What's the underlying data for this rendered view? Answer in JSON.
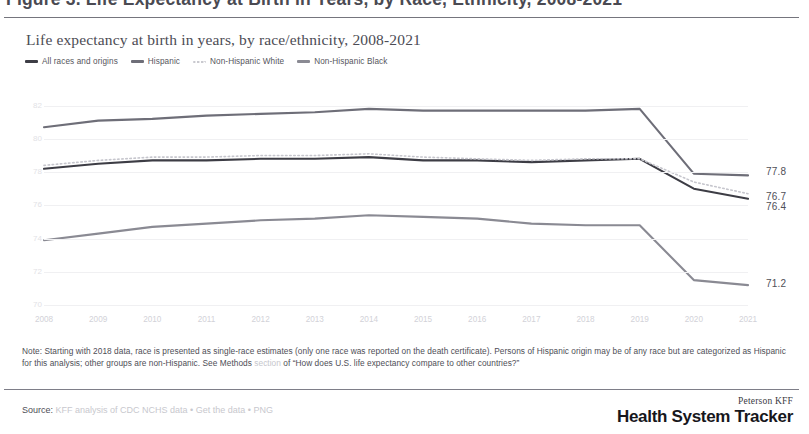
{
  "header": {
    "title": "Figure 3. Life Expectancy at Birth in Years, by Race, Ethnicity, 2008-2021"
  },
  "chart_panel": {
    "subtitle": "Life expectancy at birth in years, by race/ethnicity, 2008-2021"
  },
  "note": {
    "line1": "Note: Starting with 2018 data, race is presented as single-race estimates (only one race was reported on the death certificate). Persons of Hispanic origin may",
    "line2a": "be of any race but are categorized as Hispanic for this analysis; other groups are non-Hispanic. See Methods",
    "line2b": "section",
    "line2c": "of “How does U.S. life expectancy compare",
    "line3": "to other countries?”"
  },
  "footer": {
    "source_label": "Source:",
    "source_faded": "KFF analysis of CDC NCHS data • Get the data • PNG",
    "brand_top": "Peterson KFF",
    "brand_main": "Health System Tracker"
  },
  "chart_data": {
    "type": "line",
    "title": "Life expectancy at birth in years, by race/ethnicity, 2008-2021",
    "xlabel": "",
    "ylabel": "",
    "x": [
      2008,
      2009,
      2010,
      2011,
      2012,
      2013,
      2014,
      2015,
      2016,
      2017,
      2018,
      2019,
      2020,
      2021
    ],
    "categories": [
      "2008",
      "2009",
      "2010",
      "2011",
      "2012",
      "2013",
      "2014",
      "2015",
      "2016",
      "2017",
      "2018",
      "2019",
      "2020",
      "2021"
    ],
    "xlim": [
      2008,
      2021
    ],
    "ylim": [
      70,
      83
    ],
    "yticks": [
      70,
      72,
      74,
      76,
      78,
      80,
      82
    ],
    "ytick_labels": [
      "70",
      "72",
      "74",
      "76",
      "78",
      "80",
      "82"
    ],
    "grid": true,
    "legend_position": "top-left",
    "series": [
      {
        "name": "All races and origins",
        "color": "#3d3d45",
        "style": "solid",
        "end_label": "76.4",
        "values": [
          78.2,
          78.5,
          78.7,
          78.7,
          78.8,
          78.8,
          78.9,
          78.7,
          78.7,
          78.6,
          78.7,
          78.8,
          77.0,
          76.4
        ]
      },
      {
        "name": "Hispanic",
        "color": "#6e6e78",
        "style": "solid",
        "end_label": "77.8",
        "values": [
          80.7,
          81.1,
          81.2,
          81.4,
          81.5,
          81.6,
          81.8,
          81.7,
          81.7,
          81.7,
          81.7,
          81.8,
          77.9,
          77.8
        ]
      },
      {
        "name": "Non-Hispanic White",
        "color": "#c6c6cd",
        "style": "dotted",
        "end_label": "76.7",
        "values": [
          78.4,
          78.7,
          78.9,
          78.9,
          79.0,
          79.0,
          79.1,
          78.9,
          78.8,
          78.7,
          78.8,
          78.8,
          77.4,
          76.7
        ]
      },
      {
        "name": "Non-Hispanic Black",
        "color": "#8a8a93",
        "style": "solid",
        "end_label": "71.2",
        "values": [
          73.9,
          74.3,
          74.7,
          74.9,
          75.1,
          75.2,
          75.4,
          75.3,
          75.2,
          74.9,
          74.8,
          74.8,
          71.5,
          71.2
        ]
      }
    ]
  }
}
